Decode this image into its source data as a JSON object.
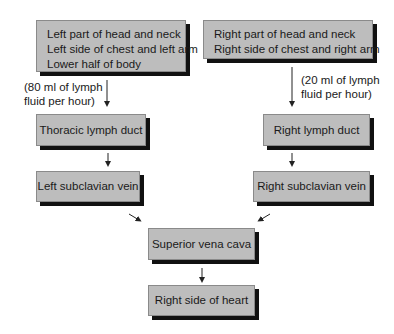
{
  "diagram": {
    "type": "flowchart",
    "nodes": {
      "left_source": {
        "lines": [
          "Left part of head and neck",
          "Left side of chest and left arm",
          "Lower half of body"
        ]
      },
      "right_source": {
        "lines": [
          "Right part of head and neck",
          "Right side of chest and right arm"
        ]
      },
      "thoracic_duct": {
        "label": "Thoracic lymph duct"
      },
      "right_lymph_duct": {
        "label": "Right lymph duct"
      },
      "left_subclavian": {
        "label": "Left subclavian vein"
      },
      "right_subclavian": {
        "label": "Right subclavian vein"
      },
      "superior_vena_cava": {
        "label": "Superior vena cava"
      },
      "right_heart": {
        "label": "Right side of heart"
      }
    },
    "annotations": {
      "left_flow": {
        "lines": [
          "(80 ml of lymph",
          "fluid per hour)"
        ]
      },
      "right_flow": {
        "lines": [
          "(20 ml of lymph",
          "fluid per hour)"
        ]
      }
    },
    "edges": [
      {
        "from": "left_source",
        "to": "thoracic_duct",
        "label": "(80 ml of lymph fluid per hour)"
      },
      {
        "from": "right_source",
        "to": "right_lymph_duct",
        "label": "(20 ml of lymph fluid per hour)"
      },
      {
        "from": "thoracic_duct",
        "to": "left_subclavian"
      },
      {
        "from": "right_lymph_duct",
        "to": "right_subclavian"
      },
      {
        "from": "left_subclavian",
        "to": "superior_vena_cava"
      },
      {
        "from": "right_subclavian",
        "to": "superior_vena_cava"
      },
      {
        "from": "superior_vena_cava",
        "to": "right_heart"
      }
    ],
    "colors": {
      "box_fill": "#bdbdbd",
      "box_shadow": "#111111",
      "text": "#1a1a1a",
      "arrow": "#222222"
    }
  }
}
